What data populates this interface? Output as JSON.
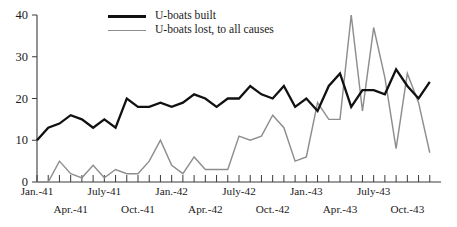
{
  "chart_data": {
    "type": "line",
    "title": "",
    "subtitle": "",
    "xlabel": "",
    "ylabel": "",
    "ylim": [
      0,
      40
    ],
    "yticks": [
      0,
      10,
      20,
      30,
      40
    ],
    "ytick_labels": [
      "0",
      "10",
      "20",
      "30",
      "40"
    ],
    "grid": false,
    "legend_position": "top-center",
    "x": [
      "Jan.-41",
      "Feb.-41",
      "Mar.-41",
      "Apr.-41",
      "May-41",
      "June-41",
      "July-41",
      "Aug.-41",
      "Sept.-41",
      "Oct.-41",
      "Nov.-41",
      "Dec.-41",
      "Jan.-42",
      "Feb.-42",
      "Mar.-42",
      "Apr.-42",
      "May-42",
      "June-42",
      "July-42",
      "Aug.-42",
      "Sept.-42",
      "Oct.-42",
      "Nov.-42",
      "Dec.-42",
      "Jan.-43",
      "Feb.-43",
      "Mar.-43",
      "Apr.-43",
      "May-43",
      "June-43",
      "July-43",
      "Aug.-43",
      "Sept.-43",
      "Oct.-43",
      "Nov.-43",
      "Dec.-43"
    ],
    "xtick_labels_row1": [
      {
        "label": "Jan.-41",
        "index": 0
      },
      {
        "label": "July-41",
        "index": 6
      },
      {
        "label": "Jan.-42",
        "index": 12
      },
      {
        "label": "July-42",
        "index": 18
      },
      {
        "label": "Jan.-43",
        "index": 24
      },
      {
        "label": "July-43",
        "index": 30
      }
    ],
    "xtick_labels_row2": [
      {
        "label": "Apr.-41",
        "index": 3
      },
      {
        "label": "Oct.-41",
        "index": 9
      },
      {
        "label": "Apr.-42",
        "index": 15
      },
      {
        "label": "Oct.-42",
        "index": 21
      },
      {
        "label": "Apr.-43",
        "index": 27
      },
      {
        "label": "Oct.-43",
        "index": 33
      }
    ],
    "series": [
      {
        "name": "U-boats built",
        "color": "#111111",
        "values": [
          10,
          13,
          14,
          16,
          15,
          13,
          15,
          13,
          20,
          18,
          18,
          19,
          18,
          19,
          21,
          20,
          18,
          20,
          20,
          23,
          21,
          20,
          23,
          18,
          20,
          17,
          23,
          26,
          18,
          22,
          22,
          21,
          27,
          23,
          20,
          24
        ]
      },
      {
        "name": "U-boats lost, to all causes",
        "color": "#8e8e8e",
        "values": [
          0,
          0,
          5,
          2,
          1,
          4,
          1,
          3,
          2,
          2,
          5,
          10,
          4,
          2,
          6,
          3,
          3,
          3,
          11,
          10,
          11,
          16,
          13,
          5,
          6,
          19,
          15,
          15,
          40,
          17,
          37,
          25,
          8,
          26,
          19,
          7
        ]
      }
    ]
  },
  "legend": {
    "items": [
      {
        "label": "U-boats built",
        "style": "built",
        "color": "#111111"
      },
      {
        "label": "U-boats lost, to all causes",
        "style": "lost",
        "color": "#8e8e8e"
      }
    ]
  },
  "axes": {
    "y_tick_labels": [
      "40",
      "30",
      "20",
      "10",
      "0"
    ],
    "x_tick_labels_upper": [
      "Jan.-41",
      "July-41",
      "Jan.-42",
      "July-42",
      "Jan.-43",
      "July-43"
    ],
    "x_tick_labels_lower": [
      "Apr.-41",
      "Oct.-41",
      "Apr.-42",
      "Oct.-42",
      "Apr.-43",
      "Oct.-43"
    ]
  }
}
